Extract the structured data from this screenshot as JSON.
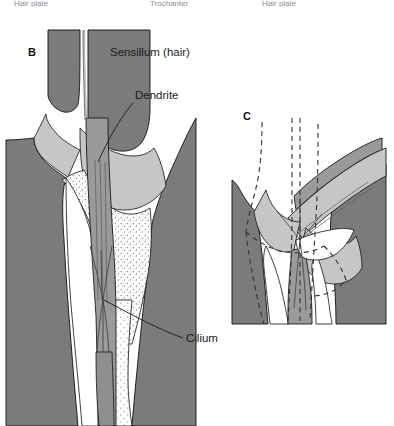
{
  "figure": {
    "background_color": "#ffffff"
  },
  "header": {
    "visible_fragments": [
      {
        "text": "Hair plate",
        "x": 14
      },
      {
        "text": "Trochanter",
        "x": 150
      },
      {
        "text": "Hair plate",
        "x": 262
      }
    ],
    "note": "clipped-top-row"
  },
  "panels": [
    {
      "id": "B",
      "letter": "B",
      "state": "resting",
      "letter_x": 28,
      "letter_y": 56
    },
    {
      "id": "C",
      "letter": "C",
      "state": "deflected",
      "letter_x": 243,
      "letter_y": 120
    }
  ],
  "callouts": [
    {
      "id": "sensillum",
      "label": "Sensillum (hair)",
      "text_x": 110,
      "text_y": 56,
      "panel": "B"
    },
    {
      "id": "dendrite",
      "label": "Dendrite",
      "text_x": 135,
      "text_y": 99,
      "panel": "B"
    },
    {
      "id": "cilium",
      "label": "Cilium",
      "text_x": 186,
      "text_y": 342,
      "panel": "B"
    }
  ],
  "annotations": [
    {
      "id": "deflection-arrow",
      "type": "curved-arrow",
      "panel": "C",
      "direction": "down-right",
      "meaning": "hair deflection direction"
    },
    {
      "id": "resting-outline",
      "type": "dashed-outline",
      "panel": "C",
      "meaning": "original resting position of sensillum"
    }
  ],
  "colors": {
    "cuticle_dark": "#7b7b7b",
    "cuticle_mid": "#c6c6c6",
    "sheath_gray": "#9a9a9a",
    "lumen_white": "#ffffff",
    "stipple_fill": "#fbfbfb",
    "outline": "#111111",
    "label_text": "#1a1a1a",
    "header_text": "#8d8d96",
    "arrow": "#6f6f6f",
    "dashed": "#333333"
  }
}
